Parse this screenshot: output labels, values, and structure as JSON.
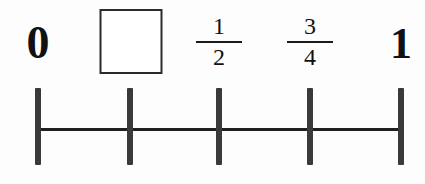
{
  "worksheet": {
    "title": "Number line with missing fraction label",
    "background_color": "#fdfdfd",
    "ink_color": "#1f1f1f"
  },
  "number_line": {
    "axis": {
      "x_start": 38,
      "x_end": 401,
      "y": 129,
      "thickness": 3,
      "color": "#1f1f1f"
    },
    "tick_style": {
      "width": 6,
      "height": 77,
      "top": 88,
      "color": "#3a3a3a"
    },
    "ticks": [
      {
        "x": 38,
        "value": "0",
        "label_type": "integer",
        "label": "0"
      },
      {
        "x": 130,
        "value": "1/4",
        "label_type": "blank",
        "label": ""
      },
      {
        "x": 219,
        "value": "1/2",
        "label_type": "fraction",
        "numerator": "1",
        "denominator": "2"
      },
      {
        "x": 310,
        "value": "3/4",
        "label_type": "fraction",
        "numerator": "3",
        "denominator": "4"
      },
      {
        "x": 401,
        "value": "1",
        "label_type": "integer",
        "label": "1"
      }
    ]
  },
  "labels": {
    "zero": "0",
    "one": "1",
    "half": {
      "numerator": "1",
      "denominator": "2"
    },
    "three_quarters": {
      "numerator": "3",
      "denominator": "4"
    }
  },
  "answer_box": {
    "x": 131,
    "y": 9,
    "width": 63,
    "height": 65,
    "value": "",
    "placeholder": "",
    "border_color": "#2b2b2b",
    "fill_color": "#ffffff"
  }
}
